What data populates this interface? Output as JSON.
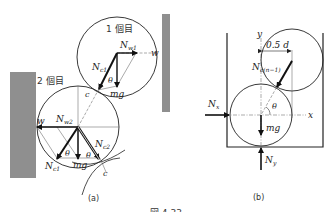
{
  "figure": {
    "caption": "図 4.33",
    "panel_a": {
      "label": "(a)",
      "ball1_label": "1 個目",
      "ball2_label": "2 個目",
      "labels": {
        "N_w1": "N",
        "N_w1_sub": "w1",
        "N_c1": "N",
        "N_c1_sub": "c1",
        "N_w2": "N",
        "N_w2_sub": "w2",
        "N_c2": "N",
        "N_c2_sub": "c2",
        "N_c1_lower": "N",
        "N_c1_lower_sub": "c1",
        "w": "w",
        "mg": "mg",
        "theta": "θ",
        "c": "c"
      }
    },
    "panel_b": {
      "label": "(b)",
      "labels": {
        "y": "y",
        "x": "x",
        "dist": "0.5 d",
        "N_cn": "N",
        "N_cn_sub": "c(n−1)",
        "N_x": "N",
        "N_x_sub": "x",
        "N_y": "N",
        "N_y_sub": "y",
        "mg": "mg",
        "theta": "θ"
      }
    },
    "colors": {
      "wall": "#8f8f8f",
      "line": "#222222",
      "arrow": "#111111"
    }
  }
}
